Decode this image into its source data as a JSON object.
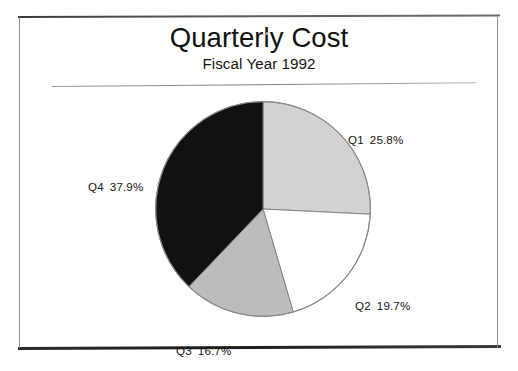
{
  "frame": {
    "name": "chart-frame"
  },
  "header": {
    "title": "Quarterly Cost",
    "subtitle": "Fiscal Year 1992"
  },
  "chart_data": {
    "type": "pie",
    "title": "Quarterly Cost",
    "subtitle": "Fiscal Year 1992",
    "xlabel": "",
    "ylabel": "",
    "legend_position": "outside-labels",
    "grid": false,
    "start_angle_deg": 0,
    "direction": "clockwise",
    "categories": [
      "Q1",
      "Q2",
      "Q3",
      "Q4"
    ],
    "values": [
      25.8,
      19.7,
      16.7,
      37.9
    ],
    "value_unit": "%",
    "colors": [
      "#d2d2d2",
      "#ffffff",
      "#bcbcbc",
      "#111111"
    ],
    "slices": [
      {
        "name": "Q1",
        "percent": 25.8,
        "label": "Q1  25.8%",
        "label_name": "Q1",
        "label_value": "25.8%",
        "color": "#d2d2d2",
        "color_name": "light-gray",
        "start_deg": 0,
        "end_deg": 92.88
      },
      {
        "name": "Q2",
        "percent": 19.7,
        "label": "Q2  19.7%",
        "label_name": "Q2",
        "label_value": "19.7%",
        "color": "#ffffff",
        "color_name": "white",
        "start_deg": 92.88,
        "end_deg": 163.8
      },
      {
        "name": "Q3",
        "percent": 16.7,
        "label": "Q3  16.7%",
        "label_name": "Q3",
        "label_value": "16.7%",
        "color": "#bcbcbc",
        "color_name": "medium-gray",
        "start_deg": 163.8,
        "end_deg": 223.92
      },
      {
        "name": "Q4",
        "percent": 37.9,
        "label": "Q4  37.9%",
        "label_name": "Q4",
        "label_value": "37.9%",
        "color": "#111111",
        "color_name": "black",
        "start_deg": 223.92,
        "end_deg": 360
      }
    ]
  }
}
